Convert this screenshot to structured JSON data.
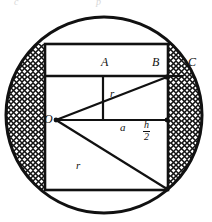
{
  "figure": {
    "type": "geometry-diagram",
    "background_color": "#ffffff",
    "stroke_color": "#111111",
    "hatch_color": "#111111",
    "points": [
      {
        "id": "A",
        "label": "A",
        "x": 111,
        "y": 62
      },
      {
        "id": "B",
        "label": "B",
        "x": 156,
        "y": 62
      },
      {
        "id": "C",
        "label": "C",
        "x": 190,
        "y": 62
      },
      {
        "id": "O",
        "label": "O",
        "x": 47,
        "y": 120
      }
    ],
    "segments": [
      {
        "id": "r-upper",
        "label": "r",
        "x": 112,
        "y": 92
      },
      {
        "id": "a",
        "label": "a",
        "x": 122,
        "y": 127
      },
      {
        "id": "r-lower",
        "label": "r",
        "x": 78,
        "y": 165
      }
    ],
    "fractions": [
      {
        "id": "h-over-2",
        "numerator": "h",
        "denominator": "2",
        "x": 147,
        "y": 127
      }
    ],
    "circle": {
      "cx": 104,
      "cy": 115,
      "r": 98
    },
    "outer_rect": {
      "x": 45,
      "y": 44,
      "width": 123,
      "height": 146
    },
    "inner_rect": {
      "x": 45,
      "y": 76,
      "width": 123,
      "height": 114
    },
    "ghost_text": [
      {
        "text": "c",
        "x": 14,
        "y": -4
      },
      {
        "text": "p",
        "x": 96,
        "y": -4
      }
    ]
  }
}
